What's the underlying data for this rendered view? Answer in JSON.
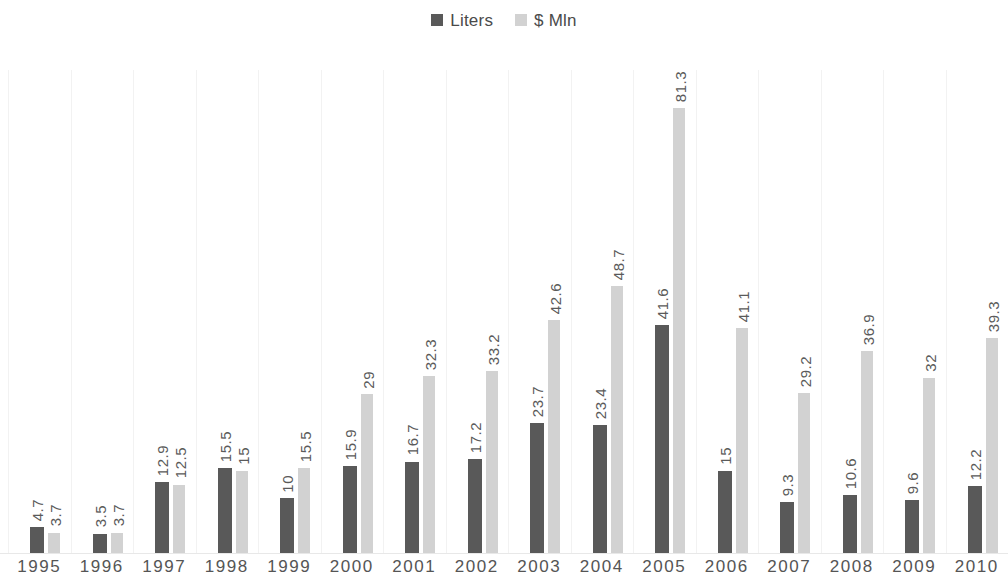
{
  "legend": {
    "position": "top-center",
    "entries": [
      {
        "label": "Liters",
        "color": "#595959",
        "icon": "square-swatch"
      },
      {
        "label": "$ Mln",
        "color": "#d2d2d2",
        "icon": "square-swatch"
      }
    ]
  },
  "chart_data": {
    "type": "bar",
    "title": "",
    "subtitle": "",
    "xlabel": "",
    "ylabel": "",
    "grid": "vertical-only",
    "legend_position": "top-center",
    "axis_visible": false,
    "ylim": [
      0,
      88
    ],
    "categories": [
      "1995",
      "1996",
      "1997",
      "1998",
      "1999",
      "2000",
      "2001",
      "2002",
      "2003",
      "2004",
      "2005",
      "2006",
      "2007",
      "2008",
      "2009",
      "2010"
    ],
    "series": [
      {
        "name": "Liters",
        "color": "#595959",
        "values": [
          4.7,
          3.5,
          12.9,
          15.5,
          10,
          15.9,
          16.7,
          17.2,
          23.7,
          23.4,
          41.6,
          15,
          9.3,
          10.6,
          9.6,
          12.2
        ],
        "labels": [
          "4.7",
          "3.5",
          "12.9",
          "15.5",
          "10",
          "15.9",
          "16.7",
          "17.2",
          "23.7",
          "23.4",
          "41.6",
          "15",
          "9.3",
          "10.6",
          "9.6",
          "12.2"
        ]
      },
      {
        "name": "$ Mln",
        "color": "#d2d2d2",
        "values": [
          3.7,
          3.7,
          12.5,
          15,
          15.5,
          29,
          32.3,
          33.2,
          42.6,
          48.7,
          81.3,
          41.1,
          29.2,
          36.9,
          32,
          39.3
        ],
        "labels": [
          "3.7",
          "3.7",
          "12.5",
          "15",
          "15.5",
          "29",
          "32.3",
          "33.2",
          "42.6",
          "48.7",
          "81.3",
          "41.1",
          "29.2",
          "36.9",
          "32",
          "39.3"
        ]
      }
    ]
  },
  "colors": {
    "background": "#ffffff",
    "series_liters": "#595959",
    "series_mln": "#d2d2d2",
    "gridline": "#f2f2f2",
    "axis": "#e8e8e8",
    "label_text": "#5a5a5a",
    "tick_text": "#555555"
  }
}
